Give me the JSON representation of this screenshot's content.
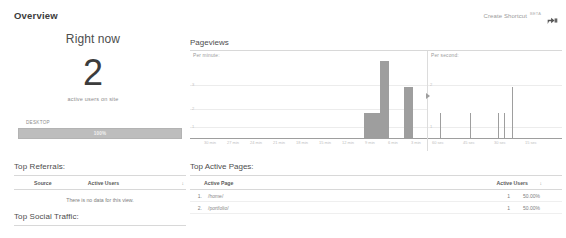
{
  "header": {
    "title": "Overview",
    "shortcut_label": "Create Shortcut",
    "beta_badge": "BETA",
    "share_icon": "share-icon"
  },
  "right_now": {
    "title": "Right now",
    "value": "2",
    "caption": "active users on site"
  },
  "device_segment": {
    "icon": "monitor-icon",
    "label": "DESKTOP",
    "percent_label": "100%",
    "bar_color": "#bdbdbd"
  },
  "top_referrals": {
    "title": "Top Referrals:",
    "columns": [
      "Source",
      "Active Users"
    ],
    "sort_caret": "↓",
    "empty_message": "There is no data for this view."
  },
  "top_social": {
    "title": "Top Social Traffic:"
  },
  "pageviews": {
    "title": "Pageviews",
    "minute_label": "Per minute:",
    "second_label": "Per second:"
  },
  "top_active_pages": {
    "title": "Top Active Pages:",
    "columns": [
      "Active Page",
      "Active Users"
    ],
    "sort_caret": "↓",
    "rows": [
      {
        "index": "1.",
        "path": "/home/",
        "users": "1",
        "percent": "50.00%"
      },
      {
        "index": "2.",
        "path": "/portfolio/",
        "users": "1",
        "percent": "50.00%"
      }
    ]
  },
  "chart_data": [
    {
      "type": "bar",
      "title": "Pageviews",
      "subtitle": "Per minute:",
      "xlabel": "minutes ago",
      "ylabel": "pageviews",
      "ylim": [
        0,
        3
      ],
      "yticks": [
        1,
        2,
        3
      ],
      "grid": true,
      "legend": null,
      "categories": [
        "30 min",
        "27 min",
        "24 min",
        "21 min",
        "18 min",
        "15 min",
        "12 min",
        "9 min",
        "6 min",
        "3 min"
      ],
      "x": [
        30,
        29,
        28,
        27,
        26,
        25,
        24,
        23,
        22,
        21,
        20,
        19,
        18,
        17,
        16,
        15,
        14,
        13,
        12,
        11,
        10,
        9,
        8,
        7,
        6,
        5,
        4,
        3,
        2,
        1
      ],
      "values": [
        0,
        0,
        0,
        0,
        0,
        0,
        0,
        0,
        0,
        0,
        0,
        0,
        0,
        0,
        0,
        0,
        0,
        0,
        0,
        0,
        0,
        0,
        1,
        1,
        3,
        0,
        0,
        2,
        0,
        0
      ],
      "bar_color": "#9e9e9e"
    },
    {
      "type": "bar",
      "title": "Pageviews",
      "subtitle": "Per second:",
      "xlabel": "seconds ago",
      "ylabel": "pageviews",
      "ylim": [
        0,
        3
      ],
      "yticks": [
        1,
        2
      ],
      "grid": true,
      "legend": null,
      "categories": [
        "60 sec",
        "45 sec",
        "30 sec",
        "15 sec"
      ],
      "x": [
        57,
        42,
        28,
        25,
        21
      ],
      "values": [
        1,
        1,
        1,
        1,
        2
      ],
      "bar_color": "#9e9e9e"
    }
  ]
}
